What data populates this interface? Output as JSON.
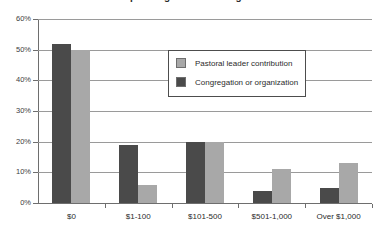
{
  "chart_data": {
    "type": "bar",
    "title": "Annual spending on continuing education",
    "title_cropped": true,
    "xlabel": "",
    "ylabel": "",
    "categories": [
      "$0",
      "$1-100",
      "$101-500",
      "$501-1,000",
      "Over $1,000"
    ],
    "series": [
      {
        "name": "Congregation or organization",
        "color": "#4a4a4a",
        "values": [
          52,
          19,
          20,
          4,
          5
        ]
      },
      {
        "name": "Pastoral leader contribution",
        "color": "#a8a8a8",
        "values": [
          50,
          6,
          20,
          11,
          13
        ]
      }
    ],
    "ylim": [
      0,
      60
    ],
    "ytick_values": [
      0,
      10,
      20,
      30,
      40,
      50,
      60
    ],
    "ytick_labels": [
      "0%",
      "10%",
      "20%",
      "30%",
      "40%",
      "50%",
      "60%"
    ],
    "grid": true,
    "grid_axis": "y",
    "legend_position": "upper-center-right",
    "legend_entries": [
      {
        "label": "Pastoral leader contribution",
        "swatch": "light"
      },
      {
        "label": "Congregation or organization",
        "swatch": "dark"
      }
    ]
  },
  "colors": {
    "series_dark": "#4a4a4a",
    "series_light": "#a8a8a8",
    "gridline": "#9a9a9a",
    "axis": "#6e6e6e",
    "text": "#2b2b2b",
    "background": "#ffffff"
  }
}
